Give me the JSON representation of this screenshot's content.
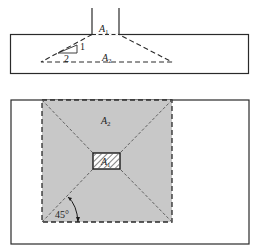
{
  "elevation": {
    "column_area_label": "A",
    "column_area_sub": "1",
    "bearing_area_label": "A",
    "bearing_area_sub": "2",
    "slope_rise": "1",
    "slope_run": "2"
  },
  "plan": {
    "bearing_area_label": "A",
    "bearing_area_sub": "2",
    "column_area_label": "A",
    "column_area_sub": "1",
    "angle_label": "45°"
  },
  "colors": {
    "line": "#2a2a2a",
    "bearing_fill": "#c8c8c8",
    "column_fill": "#ffffff"
  }
}
